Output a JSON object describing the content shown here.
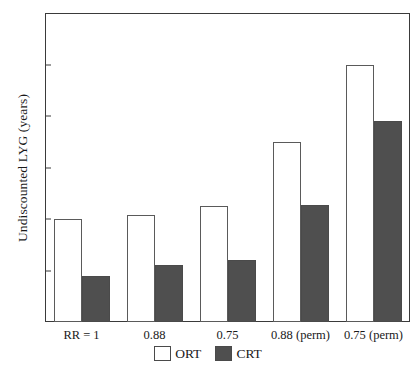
{
  "chart_data": {
    "type": "bar",
    "title": "",
    "xlabel": "",
    "ylabel": "Undiscounted LYG (years)",
    "categories": [
      "RR = 1",
      "0.88",
      "0.75",
      "0.88 (perm)",
      "0.75 (perm)"
    ],
    "series": [
      {
        "name": "ORT",
        "color": "#ffffff",
        "values": [
          0.2,
          0.208,
          0.225,
          0.35,
          0.5
        ]
      },
      {
        "name": "CRT",
        "color": "#4f4f4f",
        "values": [
          0.09,
          0.11,
          0.12,
          0.228,
          0.39
        ]
      }
    ],
    "ylim": [
      0,
      0.6
    ],
    "yticks": [
      0,
      0.1,
      0.2,
      0.3,
      0.4,
      0.5,
      0.6
    ],
    "ytick_labels": [
      "0",
      "0.1",
      "0.2",
      "0.3",
      "0.4",
      "0.5",
      "0.6"
    ],
    "grid": false,
    "legend_position": "bottom-center",
    "legend": [
      {
        "label": "ORT",
        "swatch": "open-square"
      },
      {
        "label": "CRT",
        "swatch": "filled-square"
      }
    ],
    "axis_color": "#3a3a3a",
    "background": "#ffffff"
  }
}
